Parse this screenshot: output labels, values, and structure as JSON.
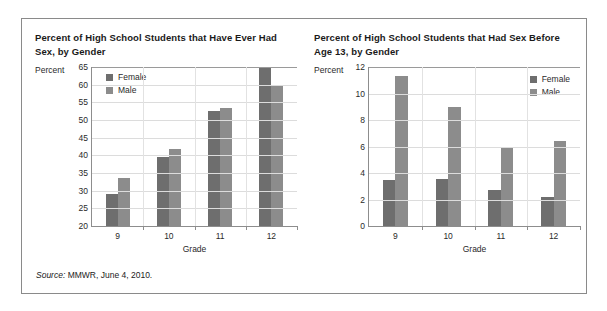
{
  "figure": {
    "source_label": "Source:",
    "source_text": " MMWR, June 4, 2010."
  },
  "colors": {
    "female": "#6e6e6e",
    "male": "#8c8c8c",
    "axis": "#8d8d8d",
    "grid": "#dcdcdc",
    "border": "#8a8a8a",
    "text": "#2a2a2a"
  },
  "legend": {
    "female_label": "Female",
    "male_label": "Male"
  },
  "chart_data": [
    {
      "type": "bar",
      "id": "ever-had-sex",
      "title": "Percent of High School Students that Have Ever Had Sex, by Gender",
      "xlabel": "Grade",
      "ylabel": "Percent",
      "categories": [
        "9",
        "10",
        "11",
        "12"
      ],
      "series": [
        {
          "name": "Female",
          "values": [
            29.2,
            39.6,
            52.5,
            65.0
          ]
        },
        {
          "name": "Male",
          "values": [
            33.6,
            41.8,
            53.5,
            59.8
          ]
        }
      ],
      "ylim": [
        20,
        65
      ],
      "yticks": [
        20,
        25,
        30,
        35,
        40,
        45,
        50,
        55,
        60,
        65
      ],
      "grid": true,
      "legend_position": "upper-left"
    },
    {
      "type": "bar",
      "id": "sex-before-13",
      "title": "Percent of High School Students that Had Sex Before Age 13, by Gender",
      "xlabel": "Grade",
      "ylabel": "Percent",
      "categories": [
        "9",
        "10",
        "11",
        "12"
      ],
      "series": [
        {
          "name": "Female",
          "values": [
            3.5,
            3.55,
            2.7,
            2.2
          ]
        },
        {
          "name": "Male",
          "values": [
            11.3,
            9.0,
            5.9,
            6.4
          ]
        }
      ],
      "ylim": [
        0,
        12
      ],
      "yticks": [
        0,
        2,
        4,
        6,
        8,
        10,
        12
      ],
      "grid": true,
      "legend_position": "upper-right"
    }
  ]
}
